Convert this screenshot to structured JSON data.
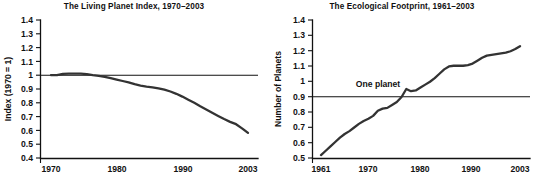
{
  "figure": {
    "background_color": "#ffffff",
    "line_color": "#333333",
    "axis_color": "#111111"
  },
  "chart_data": [
    {
      "type": "line",
      "title": "The Living Planet Index, 1970–2003",
      "xlabel": "",
      "ylabel": "Index (1970 = 1)",
      "xlim": [
        1970,
        2003
      ],
      "ylim": [
        0.4,
        1.4
      ],
      "grid": false,
      "legend": "none",
      "xticks": [
        1970,
        1980,
        1990,
        2003
      ],
      "xtick_labels": [
        "1970",
        "1980",
        "1990",
        "2003"
      ],
      "yticks": [
        0.4,
        0.5,
        0.6,
        0.7,
        0.8,
        0.9,
        1.0,
        1.1,
        1.2,
        1.3,
        1.4
      ],
      "ytick_labels": [
        "0.4",
        "0.5",
        "0.6",
        "0.7",
        "0.8",
        "0.9",
        "1",
        "1.1",
        "1.2",
        "1.3",
        "1.4"
      ],
      "reference_line": {
        "value": 1.0,
        "label": ""
      },
      "x": [
        1970,
        1971,
        1972,
        1973,
        1974,
        1975,
        1976,
        1977,
        1978,
        1979,
        1980,
        1981,
        1982,
        1983,
        1984,
        1985,
        1986,
        1987,
        1988,
        1989,
        1990,
        1991,
        1992,
        1993,
        1994,
        1995,
        1996,
        1997,
        1998,
        1999,
        2000,
        2001,
        2002,
        2003
      ],
      "values": [
        1.0,
        1.0,
        1.01,
        1.012,
        1.012,
        1.012,
        1.008,
        1.0,
        0.995,
        0.988,
        0.978,
        0.968,
        0.958,
        0.948,
        0.935,
        0.925,
        0.918,
        0.912,
        0.905,
        0.895,
        0.882,
        0.865,
        0.845,
        0.822,
        0.8,
        0.775,
        0.752,
        0.728,
        0.705,
        0.682,
        0.662,
        0.645,
        0.615,
        0.582
      ]
    },
    {
      "type": "line",
      "title": "The Ecological Footprint, 1961–2003",
      "xlabel": "",
      "ylabel": "Number of Planets",
      "xlim": [
        1961,
        2003
      ],
      "ylim": [
        0.45,
        1.4
      ],
      "grid": false,
      "legend": "none",
      "xticks": [
        1961,
        1970,
        1980,
        1990,
        2003
      ],
      "xtick_labels": [
        "1961",
        "1970",
        "1980",
        "1990",
        "2003"
      ],
      "yticks": [
        0.5,
        0.6,
        0.7,
        0.8,
        0.9,
        1.0,
        1.1,
        1.2,
        1.3,
        1.4
      ],
      "ytick_labels": [
        "0.5",
        "0.6",
        "0.7",
        "0.8",
        "0.9",
        "1",
        "1.1",
        "1.2",
        "1.3",
        "1.4"
      ],
      "reference_line": {
        "value": 1.0,
        "label": "One planet"
      },
      "x": [
        1961,
        1962,
        1963,
        1964,
        1965,
        1966,
        1967,
        1968,
        1969,
        1970,
        1971,
        1972,
        1973,
        1974,
        1975,
        1976,
        1977,
        1978,
        1979,
        1980,
        1981,
        1982,
        1983,
        1984,
        1985,
        1986,
        1987,
        1988,
        1989,
        1990,
        1991,
        1992,
        1993,
        1994,
        1995,
        1996,
        1997,
        1998,
        1999,
        2000,
        2001,
        2002,
        2003
      ],
      "values": [
        0.47,
        0.5,
        0.53,
        0.56,
        0.59,
        0.615,
        0.635,
        0.66,
        0.685,
        0.705,
        0.72,
        0.74,
        0.775,
        0.79,
        0.795,
        0.815,
        0.835,
        0.87,
        0.925,
        0.91,
        0.915,
        0.935,
        0.955,
        0.975,
        1.0,
        1.03,
        1.06,
        1.08,
        1.085,
        1.085,
        1.085,
        1.09,
        1.1,
        1.12,
        1.14,
        1.155,
        1.16,
        1.165,
        1.17,
        1.175,
        1.185,
        1.2,
        1.22
      ]
    }
  ]
}
